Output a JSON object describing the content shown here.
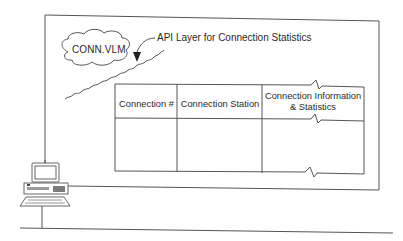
{
  "diagram": {
    "cloud_label": "CONN.VLM",
    "api_label": "API Layer for Connection Statistics",
    "table": {
      "columns": [
        "Connection #",
        "Connection Station",
        "Connection Information & Statistics"
      ],
      "column_3_lines": [
        "Connection Information",
        "& Statistics"
      ],
      "rows": [
        [
          "",
          "",
          ""
        ]
      ]
    },
    "workstation_icon": "desktop-computer-icon",
    "colors": {
      "line": "#555555",
      "text": "#2a2a2a",
      "background": "#ffffff"
    }
  }
}
